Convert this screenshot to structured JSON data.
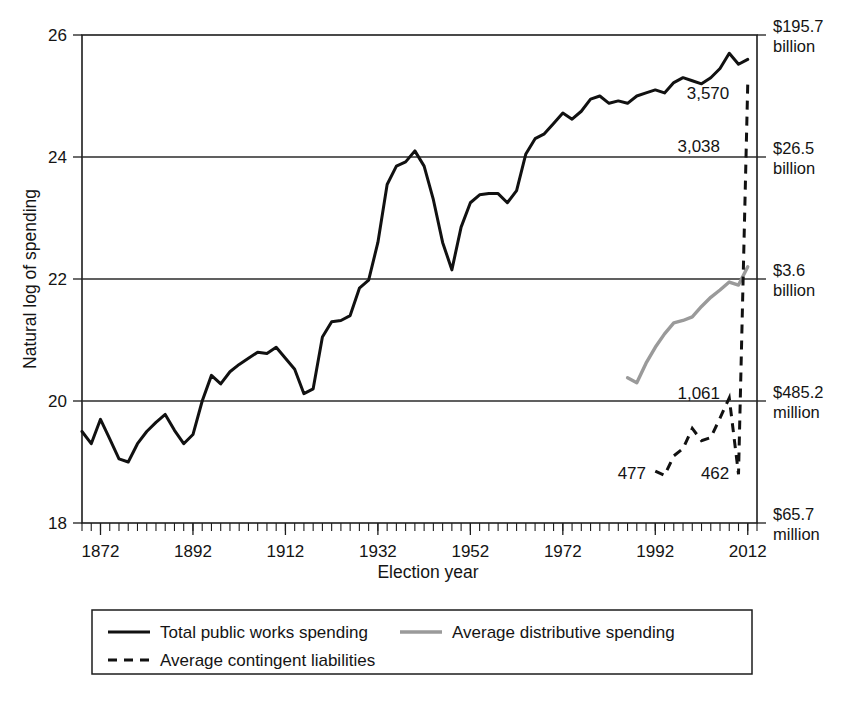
{
  "chart_data": {
    "type": "line",
    "title": "",
    "xlabel": "Election year",
    "ylabel": "Natural log of spending",
    "xlim": [
      1868,
      2014
    ],
    "ylim": [
      18,
      26
    ],
    "grid": true,
    "gridlines_y": [
      20,
      22,
      24,
      26
    ],
    "x_ticks": [
      1872,
      1892,
      1912,
      1932,
      1952,
      1972,
      1992,
      2012
    ],
    "x_tick_labels": [
      "1872",
      "1892",
      "1912",
      "1932",
      "1952",
      "1972",
      "1992",
      "2012"
    ],
    "x_minor_tick_step": 2,
    "y_ticks": [
      18,
      20,
      22,
      24,
      26
    ],
    "y_tick_labels": [
      "18",
      "20",
      "22",
      "24",
      "26"
    ],
    "secondary_axis": {
      "position": "right",
      "label": "",
      "ticks": [
        {
          "y": 26,
          "value": "$195.7",
          "unit": "billion"
        },
        {
          "y": 24,
          "value": "$26.5",
          "unit": "billion"
        },
        {
          "y": 22,
          "value": "$3.6",
          "unit": "billion"
        },
        {
          "y": 20,
          "value": "$485.2",
          "unit": "million"
        },
        {
          "y": 18,
          "value": "$65.7",
          "unit": "million"
        }
      ]
    },
    "legend": {
      "position": "below-axes",
      "entries": [
        {
          "label": "Total public works spending",
          "style": "solid",
          "color": "#111111"
        },
        {
          "label": "Average distributive spending",
          "style": "solid",
          "color": "#9a9a9a"
        },
        {
          "label": "Average contingent liabilities",
          "style": "dashed",
          "color": "#111111"
        }
      ]
    },
    "annotations": [
      {
        "text": "3,570",
        "x": 2008,
        "y": 25.05,
        "series": "Total public works spending"
      },
      {
        "text": "3,038",
        "x": 2006,
        "y": 24.18,
        "series": "Average contingent liabilities"
      },
      {
        "text": "1,061",
        "x": 2006,
        "y": 20.13,
        "series": "Average contingent liabilities"
      },
      {
        "text": "477",
        "x": 1990,
        "y": 18.82,
        "series": "Average contingent liabilities"
      },
      {
        "text": "462",
        "x": 2008,
        "y": 18.82,
        "series": "Average contingent liabilities"
      }
    ],
    "series": [
      {
        "name": "Total public works spending",
        "style": "solid",
        "color": "#111111",
        "x": [
          1868,
          1870,
          1872,
          1874,
          1876,
          1878,
          1880,
          1882,
          1884,
          1886,
          1888,
          1890,
          1892,
          1894,
          1896,
          1898,
          1900,
          1902,
          1904,
          1906,
          1908,
          1910,
          1912,
          1914,
          1916,
          1918,
          1920,
          1922,
          1924,
          1926,
          1928,
          1930,
          1932,
          1934,
          1936,
          1938,
          1940,
          1942,
          1944,
          1946,
          1948,
          1950,
          1952,
          1954,
          1956,
          1958,
          1960,
          1962,
          1964,
          1966,
          1968,
          1970,
          1972,
          1974,
          1976,
          1978,
          1980,
          1982,
          1984,
          1986,
          1988,
          1990,
          1992,
          1994,
          1996,
          1998,
          2000,
          2002,
          2004,
          2006,
          2008,
          2010,
          2012
        ],
        "y": [
          19.5,
          19.3,
          19.7,
          19.38,
          19.05,
          19.0,
          19.3,
          19.5,
          19.65,
          19.78,
          19.52,
          19.3,
          19.45,
          20.0,
          20.42,
          20.28,
          20.48,
          20.6,
          20.7,
          20.8,
          20.78,
          20.88,
          20.7,
          20.52,
          20.12,
          20.2,
          21.05,
          21.3,
          21.32,
          21.4,
          21.85,
          21.98,
          22.6,
          23.55,
          23.85,
          23.92,
          24.1,
          23.85,
          23.3,
          22.6,
          22.15,
          22.85,
          23.25,
          23.38,
          23.4,
          23.4,
          23.25,
          23.45,
          24.05,
          24.3,
          24.38,
          24.55,
          24.72,
          24.62,
          24.75,
          24.95,
          25.0,
          24.88,
          24.92,
          24.88,
          25.0,
          25.05,
          25.1,
          25.05,
          25.22,
          25.3,
          25.25,
          25.2,
          25.3,
          25.45,
          25.7,
          25.52,
          25.6
        ]
      },
      {
        "name": "Average distributive spending",
        "style": "solid",
        "color": "#9a9a9a",
        "x": [
          1986,
          1988,
          1990,
          1992,
          1994,
          1996,
          1998,
          2000,
          2002,
          2004,
          2006,
          2008,
          2010,
          2012
        ],
        "y": [
          20.38,
          20.3,
          20.62,
          20.88,
          21.1,
          21.28,
          21.32,
          21.38,
          21.55,
          21.7,
          21.82,
          21.95,
          21.9,
          22.2
        ]
      },
      {
        "name": "Average contingent liabilities",
        "style": "dashed",
        "color": "#111111",
        "x": [
          1992,
          1994,
          1996,
          1998,
          2000,
          2002,
          2004,
          2006,
          2008,
          2010,
          2012
        ],
        "y": [
          18.85,
          18.78,
          19.1,
          19.22,
          19.55,
          19.35,
          19.4,
          19.72,
          20.05,
          18.8,
          25.2
        ]
      }
    ]
  },
  "figure": {
    "y_axis_title": "Natural log of spending",
    "x_axis_title": "Election year"
  }
}
